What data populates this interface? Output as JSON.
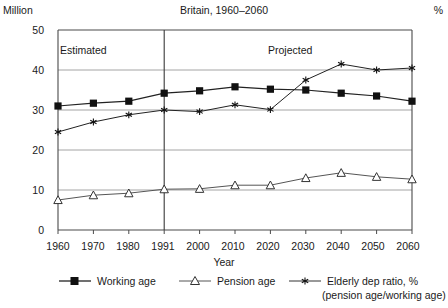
{
  "header": {
    "unit_left": "Million",
    "title": "Britain, 1960–2060",
    "unit_right": "%"
  },
  "axes": {
    "x_title": "Year",
    "y_ticks": [
      "0",
      "10",
      "20",
      "30",
      "40",
      "50"
    ],
    "x_ticks": [
      "1960",
      "1970",
      "1980",
      "1991",
      "2000",
      "2010",
      "2020",
      "2030",
      "2040",
      "2050",
      "2060"
    ]
  },
  "annotations": {
    "estimated": "Estimated",
    "projected": "Projected",
    "divider_year": "1991"
  },
  "legend": {
    "items": [
      {
        "label": "Working age",
        "marker": "filled-square",
        "color": "#111111"
      },
      {
        "label": "Pension age",
        "marker": "open-triangle",
        "color": "#555555"
      },
      {
        "label": "Elderly dep ratio, %",
        "sub": "(pension age/working age)",
        "marker": "star",
        "color": "#333333"
      }
    ]
  },
  "chart_data": {
    "type": "line",
    "title": "Britain, 1960–2060",
    "xlabel": "Year",
    "ylabel": "Million",
    "y2label": "%",
    "xlim": [
      1960,
      2060
    ],
    "ylim": [
      0,
      50
    ],
    "grid": true,
    "legend_position": "bottom",
    "x": [
      1960,
      1970,
      1980,
      1991,
      2000,
      2010,
      2020,
      2030,
      2040,
      2050,
      2060
    ],
    "categories": [
      "1960",
      "1970",
      "1980",
      "1991",
      "2000",
      "2010",
      "2020",
      "2030",
      "2040",
      "2050",
      "2060"
    ],
    "series": [
      {
        "name": "Working age",
        "marker": "filled-square",
        "values": [
          31.0,
          31.7,
          32.2,
          34.2,
          34.8,
          35.8,
          35.2,
          35.0,
          34.2,
          33.5,
          32.2
        ]
      },
      {
        "name": "Pension age",
        "marker": "open-triangle",
        "values": [
          7.5,
          8.7,
          9.2,
          10.2,
          10.3,
          11.2,
          11.2,
          13.0,
          14.3,
          13.3,
          12.7
        ]
      },
      {
        "name": "Elderly dep ratio, % (pension age/working age)",
        "marker": "star",
        "values": [
          24.5,
          27.0,
          28.8,
          30.0,
          29.6,
          31.3,
          30.1,
          37.5,
          41.5,
          40.0,
          40.5
        ]
      }
    ],
    "annotations": [
      {
        "text": "Estimated",
        "x_range": [
          1960,
          1991
        ]
      },
      {
        "text": "Projected",
        "x_range": [
          1991,
          2060
        ]
      },
      {
        "text": "divider",
        "x": 1991
      }
    ]
  }
}
